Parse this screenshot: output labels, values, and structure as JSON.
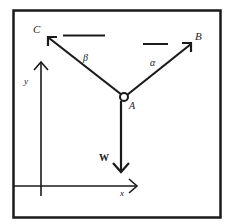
{
  "diagram": {
    "type": "force-diagram",
    "labels": {
      "point_c": "C",
      "point_b": "B",
      "point_a": "A",
      "angle_beta": "β",
      "angle_alpha": "α",
      "weight": "W",
      "axis_x": "x",
      "axis_y": "y"
    },
    "colors": {
      "stroke": "#1a1a1a",
      "background": "#ffffff"
    }
  }
}
